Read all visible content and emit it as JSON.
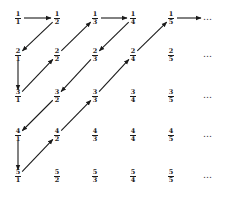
{
  "grid": {
    "col_x": [
      18,
      57,
      95,
      133,
      171
    ],
    "row_y": [
      18,
      55,
      96,
      135,
      176
    ],
    "dots_x": 203,
    "ellipsis": "…"
  },
  "rows": [
    [
      {
        "n": "1",
        "d": "1"
      },
      {
        "n": "1",
        "d": "2"
      },
      {
        "n": "1",
        "d": "3"
      },
      {
        "n": "1",
        "d": "4"
      },
      {
        "n": "1",
        "d": "5"
      }
    ],
    [
      {
        "n": "2",
        "d": "1"
      },
      {
        "n": "2",
        "d": "2"
      },
      {
        "n": "2",
        "d": "3"
      },
      {
        "n": "2",
        "d": "4"
      },
      {
        "n": "2",
        "d": "5"
      }
    ],
    [
      {
        "n": "3",
        "d": "1"
      },
      {
        "n": "3",
        "d": "2"
      },
      {
        "n": "3",
        "d": "3"
      },
      {
        "n": "3",
        "d": "4"
      },
      {
        "n": "3",
        "d": "5"
      }
    ],
    [
      {
        "n": "4",
        "d": "1"
      },
      {
        "n": "4",
        "d": "2"
      },
      {
        "n": "4",
        "d": "3"
      },
      {
        "n": "4",
        "d": "4"
      },
      {
        "n": "4",
        "d": "5"
      }
    ],
    [
      {
        "n": "5",
        "d": "1"
      },
      {
        "n": "5",
        "d": "2"
      },
      {
        "n": "5",
        "d": "3"
      },
      {
        "n": "5",
        "d": "4"
      },
      {
        "n": "5",
        "d": "5"
      }
    ]
  ],
  "path": [
    [
      0,
      0
    ],
    [
      0,
      1
    ],
    [
      1,
      0
    ],
    [
      2,
      0
    ],
    [
      1,
      1
    ],
    [
      0,
      2
    ],
    [
      0,
      3
    ],
    [
      1,
      2
    ],
    [
      2,
      1
    ],
    [
      3,
      0
    ],
    [
      4,
      0
    ],
    [
      3,
      1
    ],
    [
      2,
      2
    ],
    [
      1,
      3
    ],
    [
      0,
      4
    ]
  ],
  "path_end_arrow_to_dots_row": 0,
  "colors": {
    "ink": "#1a1a1a",
    "background": "#ffffff"
  }
}
